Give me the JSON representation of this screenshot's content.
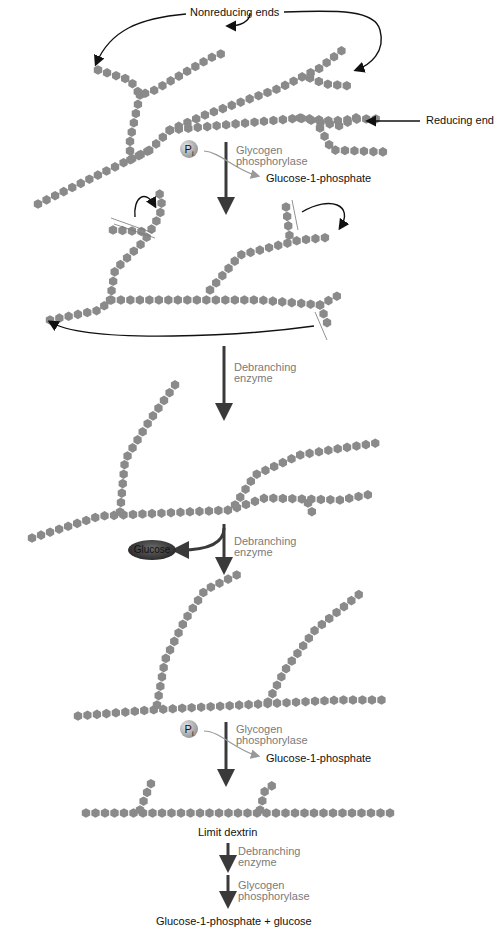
{
  "figure": {
    "colors": {
      "glucose_unit": "#8a8a8a",
      "arrow_main": "#3a3a3a",
      "enzyme_label": "#7a7a7a",
      "text": "#111111"
    }
  },
  "stage1": {
    "nonreducing_label": "Nonreducing ends",
    "reducing_label": "Reducing end"
  },
  "step1": {
    "pi_label": "P",
    "pi_sub": "i",
    "enzyme_line1": "Glycogen",
    "enzyme_line2": "phosphorylase",
    "product": "Glucose-1-phosphate"
  },
  "step2": {
    "enzyme_line1": "Debranching",
    "enzyme_line2": "enzyme"
  },
  "step3": {
    "released": "Glucose",
    "enzyme_line1": "Debranching",
    "enzyme_line2": "enzyme"
  },
  "step4": {
    "pi_label": "P",
    "pi_sub": "i",
    "enzyme_line1": "Glycogen",
    "enzyme_line2": "phosphorylase",
    "product": "Glucose-1-phosphate"
  },
  "limit": {
    "label": "Limit dextrin"
  },
  "step5": {
    "enzyme_a_line1": "Debranching",
    "enzyme_a_line2": "enzyme",
    "enzyme_b_line1": "Glycogen",
    "enzyme_b_line2": "phosphorylase",
    "final_product": "Glucose-1-phosphate + glucose"
  },
  "chains": [
    {
      "stage": 1,
      "pts": [
        [
          38,
          204
        ],
        [
          150,
          150
        ],
        [
          170,
          130
        ],
        [
          300,
          118
        ],
        [
          340,
          126
        ],
        [
          360,
          116
        ]
      ]
    },
    {
      "stage": 1,
      "pts": [
        [
          98,
          70
        ],
        [
          130,
          80
        ],
        [
          140,
          95
        ],
        [
          155,
          90
        ],
        [
          210,
          58
        ],
        [
          226,
          52
        ]
      ]
    },
    {
      "stage": 1,
      "pts": [
        [
          140,
          95
        ],
        [
          130,
          140
        ],
        [
          130,
          160
        ],
        [
          150,
          150
        ]
      ]
    },
    {
      "stage": 1,
      "pts": [
        [
          170,
          130
        ],
        [
          205,
          115
        ],
        [
          280,
          88
        ],
        [
          320,
          68
        ],
        [
          345,
          48
        ]
      ]
    },
    {
      "stage": 1,
      "pts": [
        [
          310,
          78
        ],
        [
          325,
          84
        ],
        [
          350,
          86
        ]
      ]
    },
    {
      "stage": 1,
      "pts": [
        [
          300,
          118
        ],
        [
          332,
          121
        ],
        [
          358,
          119
        ],
        [
          380,
          119
        ]
      ]
    },
    {
      "stage": 1,
      "pts": [
        [
          320,
          128
        ],
        [
          332,
          150
        ],
        [
          385,
          152
        ]
      ]
    },
    {
      "stage": 2,
      "pts": [
        [
          50,
          320
        ],
        [
          100,
          310
        ],
        [
          110,
          300
        ],
        [
          200,
          300
        ],
        [
          260,
          300
        ],
        [
          320,
          305
        ]
      ]
    },
    {
      "stage": 2,
      "pts": [
        [
          110,
          300
        ],
        [
          115,
          270
        ],
        [
          145,
          240
        ],
        [
          160,
          215
        ],
        [
          162,
          200
        ],
        [
          158,
          190
        ]
      ]
    },
    {
      "stage": 2,
      "pts": [
        [
          113,
          230
        ],
        [
          150,
          232
        ]
      ]
    },
    {
      "stage": 2,
      "pts": [
        [
          210,
          290
        ],
        [
          240,
          255
        ],
        [
          300,
          240
        ],
        [
          333,
          237
        ]
      ]
    },
    {
      "stage": 2,
      "pts": [
        [
          286,
          207
        ],
        [
          290,
          240
        ]
      ]
    },
    {
      "stage": 2,
      "pts": [
        [
          320,
          305
        ],
        [
          345,
          292
        ]
      ]
    },
    {
      "stage": 2,
      "pts": [
        [
          320,
          305
        ],
        [
          330,
          330
        ]
      ]
    },
    {
      "stage": 3,
      "pts": [
        [
          32,
          538
        ],
        [
          100,
          516
        ],
        [
          230,
          510
        ],
        [
          265,
          498
        ],
        [
          340,
          500
        ],
        [
          372,
          494
        ]
      ]
    },
    {
      "stage": 3,
      "pts": [
        [
          120,
          512
        ],
        [
          125,
          460
        ],
        [
          150,
          420
        ],
        [
          180,
          378
        ]
      ]
    },
    {
      "stage": 3,
      "pts": [
        [
          235,
          505
        ],
        [
          255,
          475
        ],
        [
          300,
          455
        ],
        [
          330,
          450
        ],
        [
          383,
          442
        ]
      ]
    },
    {
      "stage": 3,
      "pts": [
        [
          308,
          503
        ],
        [
          312,
          512
        ]
      ]
    },
    {
      "stage": 4,
      "pts": [
        [
          78,
          716
        ],
        [
          150,
          710
        ],
        [
          260,
          704
        ],
        [
          340,
          700
        ],
        [
          388,
          700
        ]
      ]
    },
    {
      "stage": 4,
      "pts": [
        [
          157,
          705
        ],
        [
          165,
          660
        ],
        [
          185,
          620
        ],
        [
          205,
          590
        ],
        [
          241,
          573
        ]
      ]
    },
    {
      "stage": 4,
      "pts": [
        [
          268,
          702
        ],
        [
          285,
          670
        ],
        [
          315,
          630
        ],
        [
          362,
          592
        ]
      ]
    },
    {
      "stage": 5,
      "pts": [
        [
          86,
          813
        ],
        [
          390,
          813
        ]
      ]
    },
    {
      "stage": 5,
      "pts": [
        [
          140,
          810
        ],
        [
          150,
          785
        ],
        [
          155,
          778
        ]
      ]
    },
    {
      "stage": 5,
      "pts": [
        [
          260,
          810
        ],
        [
          265,
          790
        ],
        [
          278,
          782
        ]
      ]
    }
  ]
}
